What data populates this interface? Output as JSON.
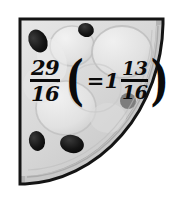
{
  "figure": {
    "shape_name": "quarter-circle-pizza",
    "alt_text": "A quarter of a pizza shown in grayscale with olive toppings, labeled with the fraction twenty-nine sixteenths equals one and thirteen sixteenths",
    "background_color": "#ffffff",
    "outline_color": "#141414",
    "crust_color": "#b5b5b5",
    "crust_rim_color": "#d0d0d0",
    "cheese_color": "#dedede",
    "cheese_highlight_color": "#efefef",
    "olive_color": "#161616",
    "olive_soft_color": "#7d7d7d"
  },
  "label": {
    "expression_plain": "29/16 (= 1 13/16)",
    "improper_fraction": {
      "numerator": "29",
      "denominator": "16"
    },
    "open_paren": "(",
    "equals_sign": "=",
    "whole_number": "1",
    "proper_fraction": {
      "numerator": "13",
      "denominator": "16"
    },
    "close_paren": ")",
    "text_color": "#0b0b0b"
  },
  "toppings": {
    "olives": [
      {
        "name": "olive-top-left",
        "cx": 38,
        "cy": 41,
        "rx": 9,
        "ry": 12,
        "rotate": -28,
        "fill": "#161616"
      },
      {
        "name": "olive-top-center",
        "cx": 86,
        "cy": 30,
        "rx": 8,
        "ry": 7,
        "rotate": 15,
        "fill": "#161616"
      },
      {
        "name": "olive-right-mid",
        "cx": 128,
        "cy": 101,
        "rx": 8,
        "ry": 8,
        "rotate": 0,
        "fill": "#7d7d7d"
      },
      {
        "name": "olive-bottom-left",
        "cx": 37,
        "cy": 141,
        "rx": 8,
        "ry": 10,
        "rotate": -12,
        "fill": "#161616"
      },
      {
        "name": "olive-bottom-center",
        "cx": 72,
        "cy": 144,
        "rx": 12,
        "ry": 9,
        "rotate": 12,
        "fill": "#161616"
      }
    ],
    "cheese_blobs": [
      {
        "name": "cheese-blob-top-center",
        "cx": 72,
        "cy": 46,
        "rx": 22,
        "ry": 20
      },
      {
        "name": "cheese-blob-top-right",
        "cx": 122,
        "cy": 52,
        "rx": 30,
        "ry": 26
      },
      {
        "name": "cheese-blob-center",
        "cx": 66,
        "cy": 108,
        "rx": 30,
        "ry": 27
      },
      {
        "name": "cheese-blob-left",
        "cx": 40,
        "cy": 85,
        "rx": 17,
        "ry": 18
      },
      {
        "name": "cheese-blob-bottom-right",
        "cx": 108,
        "cy": 118,
        "rx": 18,
        "ry": 15
      }
    ]
  }
}
